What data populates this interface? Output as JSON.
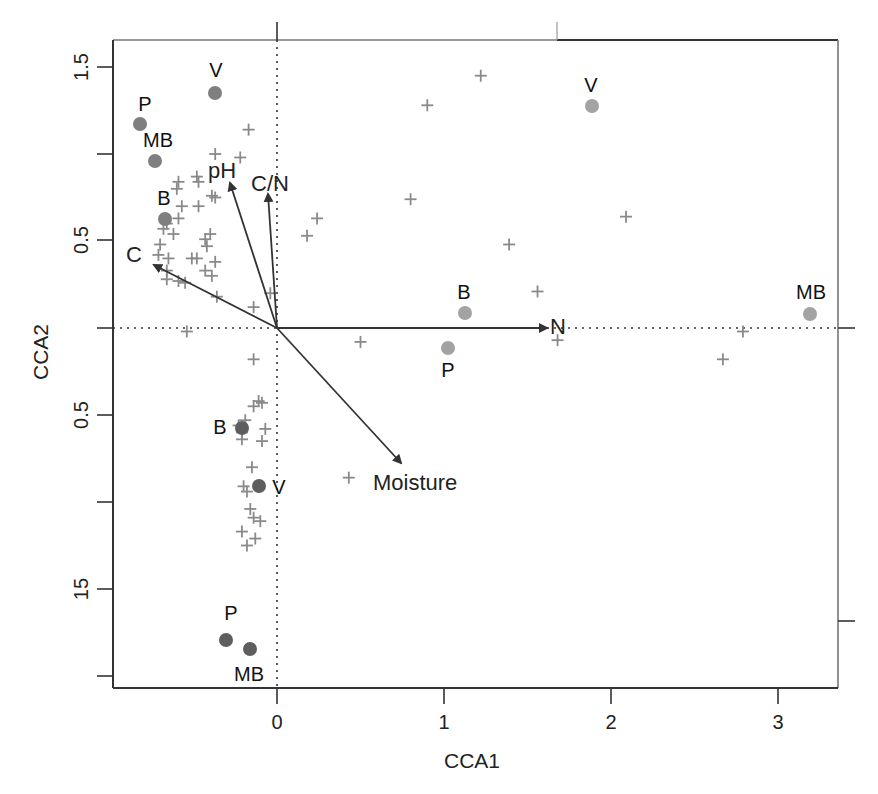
{
  "chart_data": {
    "type": "scatter",
    "subtype": "CCA ordination biplot",
    "title": "",
    "xlabel": "CCA1",
    "ylabel": "CCA2",
    "xlim": [
      -0.98,
      3.35
    ],
    "ylim": [
      -2.07,
      1.65
    ],
    "x_ticks": [
      {
        "value": 0,
        "label": "0"
      },
      {
        "value": 1,
        "label": "1"
      },
      {
        "value": 2,
        "label": "2"
      },
      {
        "value": 3,
        "label": "3"
      }
    ],
    "y_ticks": [
      {
        "value": 1.5,
        "label": "1.5"
      },
      {
        "value": 1.0,
        "label": ""
      },
      {
        "value": 0.5,
        "label": "0.5"
      },
      {
        "value": 0,
        "label": ""
      },
      {
        "value": -0.5,
        "label": "0.5"
      },
      {
        "value": -1.0,
        "label": ""
      },
      {
        "value": -1.5,
        "label": "15"
      },
      {
        "value": -2.0,
        "label": ""
      }
    ],
    "grid": false,
    "zero_lines": "dotted",
    "legend": null,
    "sites": [
      {
        "label": "V",
        "x": -0.37,
        "y": 1.36,
        "group": "mid",
        "color": "#7f7f7f"
      },
      {
        "label": "P",
        "x": -0.82,
        "y": 1.17,
        "group": "mid",
        "color": "#7f7f7f"
      },
      {
        "label": "MB",
        "x": -0.73,
        "y": 0.96,
        "group": "mid",
        "color": "#7f7f7f"
      },
      {
        "label": "B",
        "x": -0.67,
        "y": 0.62,
        "group": "mid",
        "color": "#7f7f7f"
      },
      {
        "label": "V",
        "x": 1.89,
        "y": 1.28,
        "group": "light",
        "color": "#a3a3a3"
      },
      {
        "label": "B",
        "x": 1.13,
        "y": 0.09,
        "group": "light",
        "color": "#a3a3a3"
      },
      {
        "label": "P",
        "x": 1.03,
        "y": -0.11,
        "group": "light",
        "color": "#a3a3a3"
      },
      {
        "label": "MB",
        "x": 3.2,
        "y": 0.08,
        "group": "light",
        "color": "#a3a3a3"
      },
      {
        "label": "B",
        "x": -0.21,
        "y": -0.58,
        "group": "dark",
        "color": "#5e5e5e"
      },
      {
        "label": "V",
        "x": -0.11,
        "y": -0.91,
        "group": "dark",
        "color": "#5e5e5e"
      },
      {
        "label": "P",
        "x": -0.3,
        "y": -1.79,
        "group": "dark",
        "color": "#5e5e5e"
      },
      {
        "label": "MB",
        "x": -0.16,
        "y": -1.84,
        "group": "dark",
        "color": "#5e5e5e"
      }
    ],
    "environmental_vectors": [
      {
        "label": "C",
        "x": -0.74,
        "y": 0.36
      },
      {
        "label": "pH",
        "x": -0.28,
        "y": 0.89
      },
      {
        "label": "C/N",
        "x": -0.05,
        "y": 0.86
      },
      {
        "label": "N",
        "x": 1.63,
        "y": 0.0
      },
      {
        "label": "Moisture",
        "x": 0.76,
        "y": -0.77
      }
    ],
    "species": [
      [
        -0.17,
        1.14
      ],
      [
        -0.22,
        0.98
      ],
      [
        -0.37,
        1.0
      ],
      [
        -0.48,
        0.87
      ],
      [
        -0.47,
        0.84
      ],
      [
        -0.59,
        0.84
      ],
      [
        -0.6,
        0.8
      ],
      [
        -0.39,
        0.76
      ],
      [
        -0.37,
        0.75
      ],
      [
        -0.47,
        0.7
      ],
      [
        -0.57,
        0.7
      ],
      [
        -0.59,
        0.63
      ],
      [
        -0.66,
        0.6
      ],
      [
        -0.68,
        0.57
      ],
      [
        -0.62,
        0.54
      ],
      [
        -0.4,
        0.54
      ],
      [
        -0.43,
        0.51
      ],
      [
        -0.7,
        0.48
      ],
      [
        -0.42,
        0.47
      ],
      [
        -0.71,
        0.42
      ],
      [
        -0.65,
        0.4
      ],
      [
        -0.48,
        0.4
      ],
      [
        -0.51,
        0.4
      ],
      [
        -0.37,
        0.38
      ],
      [
        -0.43,
        0.33
      ],
      [
        -0.66,
        0.33
      ],
      [
        -0.39,
        0.3
      ],
      [
        -0.66,
        0.28
      ],
      [
        -0.59,
        0.27
      ],
      [
        -0.55,
        0.26
      ],
      [
        -0.36,
        0.18
      ],
      [
        -0.14,
        0.12
      ],
      [
        -0.04,
        0.2
      ],
      [
        -0.54,
        -0.02
      ],
      [
        -0.14,
        -0.18
      ],
      [
        0.18,
        0.53
      ],
      [
        0.24,
        0.63
      ],
      [
        0.5,
        -0.08
      ],
      [
        0.9,
        1.28
      ],
      [
        1.22,
        1.45
      ],
      [
        0.8,
        0.74
      ],
      [
        1.39,
        0.48
      ],
      [
        1.56,
        0.21
      ],
      [
        1.68,
        -0.07
      ],
      [
        2.09,
        0.64
      ],
      [
        2.79,
        -0.02
      ],
      [
        2.67,
        -0.18
      ],
      [
        -0.09,
        -0.43
      ],
      [
        -0.11,
        -0.42
      ],
      [
        -0.14,
        -0.45
      ],
      [
        -0.19,
        -0.53
      ],
      [
        -0.23,
        -0.56
      ],
      [
        -0.21,
        -0.6
      ],
      [
        -0.07,
        -0.58
      ],
      [
        -0.09,
        -0.65
      ],
      [
        -0.21,
        -0.64
      ],
      [
        -0.15,
        -0.8
      ],
      [
        -0.2,
        -0.91
      ],
      [
        -0.18,
        -0.94
      ],
      [
        -0.16,
        -1.04
      ],
      [
        -0.14,
        -1.09
      ],
      [
        -0.1,
        -1.11
      ],
      [
        -0.21,
        -1.17
      ],
      [
        -0.13,
        -1.21
      ],
      [
        -0.18,
        -1.25
      ],
      [
        0.43,
        -0.86
      ]
    ]
  },
  "axes": {
    "x_title": "CCA1",
    "y_title": "CCA2",
    "x_tick_labels": [
      "0",
      "1",
      "2",
      "3"
    ],
    "y_tick_labels": [
      "1.5",
      "0.5",
      "0.5",
      "15"
    ]
  },
  "labels": {
    "env": {
      "C": "C",
      "pH": "pH",
      "CN": "C/N",
      "N": "N",
      "moisture": "Moisture"
    },
    "sites": {
      "s1": "V",
      "s2": "P",
      "s3": "MB",
      "s4": "B",
      "s5": "V",
      "s6": "B",
      "s7": "P",
      "s8": "MB",
      "s9": "B",
      "s10": "V",
      "s11": "P",
      "s12": "MB"
    }
  },
  "colors": {
    "site_mid": "#7f7f7f",
    "site_light": "#a3a3a3",
    "site_dark": "#5e5e5e",
    "species": "#8a8a8a",
    "axis": "#333333"
  }
}
